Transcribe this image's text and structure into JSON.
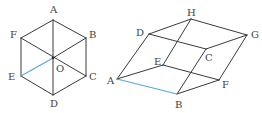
{
  "figures": [
    {
      "name": "regular-hexagon",
      "points": {
        "A": [
          53,
          20
        ],
        "B": [
          86,
          38
        ],
        "C": [
          86,
          76
        ],
        "D": [
          53,
          95
        ],
        "E": [
          21,
          76
        ],
        "F": [
          21,
          38
        ],
        "O": [
          53,
          58
        ]
      },
      "edges": [
        [
          "A",
          "B"
        ],
        [
          "B",
          "C"
        ],
        [
          "C",
          "D"
        ],
        [
          "D",
          "E"
        ],
        [
          "E",
          "F"
        ],
        [
          "F",
          "A"
        ],
        [
          "A",
          "D"
        ],
        [
          "F",
          "C"
        ],
        [
          "B",
          "O"
        ]
      ],
      "highlighted_edges": [
        [
          "E",
          "O"
        ]
      ],
      "labels": [
        {
          "text": "A",
          "x": 50,
          "y": 13
        },
        {
          "text": "B",
          "x": 89,
          "y": 38
        },
        {
          "text": "C",
          "x": 89,
          "y": 80
        },
        {
          "text": "D",
          "x": 50,
          "y": 107
        },
        {
          "text": "E",
          "x": 8,
          "y": 80
        },
        {
          "text": "F",
          "x": 10,
          "y": 38
        },
        {
          "text": "O",
          "x": 56,
          "y": 72
        }
      ]
    },
    {
      "name": "parallelepiped",
      "points": {
        "A": [
          117,
          79
        ],
        "B": [
          177,
          94
        ],
        "C": [
          206,
          49
        ],
        "D": [
          149,
          34
        ],
        "E": [
          163,
          65
        ],
        "F": [
          219,
          80
        ],
        "G": [
          247,
          35
        ],
        "H": [
          191,
          19
        ]
      },
      "edges": [
        [
          "B",
          "F"
        ],
        [
          "F",
          "E"
        ],
        [
          "E",
          "A"
        ],
        [
          "D",
          "C"
        ],
        [
          "C",
          "G"
        ],
        [
          "G",
          "H"
        ],
        [
          "H",
          "D"
        ],
        [
          "A",
          "D"
        ],
        [
          "B",
          "C"
        ],
        [
          "F",
          "G"
        ],
        [
          "E",
          "H"
        ]
      ],
      "highlighted_edges": [
        [
          "A",
          "B"
        ]
      ],
      "labels": [
        {
          "text": "H",
          "x": 187,
          "y": 16
        },
        {
          "text": "D",
          "x": 136,
          "y": 36
        },
        {
          "text": "G",
          "x": 251,
          "y": 38
        },
        {
          "text": "C",
          "x": 205,
          "y": 61
        },
        {
          "text": "E",
          "x": 154,
          "y": 65
        },
        {
          "text": "A",
          "x": 107,
          "y": 84
        },
        {
          "text": "F",
          "x": 222,
          "y": 88
        },
        {
          "text": "B",
          "x": 175,
          "y": 108
        }
      ]
    }
  ],
  "colors": {
    "edge": "#3a3a3a",
    "highlight": "#5aa8d8",
    "label": "#444444"
  }
}
